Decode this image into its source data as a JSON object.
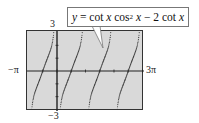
{
  "chart_data": {
    "type": "line",
    "function": "y = cot(x)*cos(x)^2 - 2*cot(x)",
    "xlabel": "",
    "ylabel": "",
    "xlim": [
      -3.14159,
      9.42478
    ],
    "ylim": [
      -3,
      3
    ],
    "x_tick_labels": {
      "min": "−π",
      "max": "3π"
    },
    "y_tick_labels": {
      "max": "3",
      "min": "−3"
    },
    "x_scale_ticks": "π/2",
    "y_scale_ticks": 1,
    "asymptotes_x": [
      0,
      3.14159,
      6.28319
    ],
    "zeros_x": [
      -1.5708,
      1.5708,
      4.71239,
      7.85398
    ],
    "style": "dotted",
    "grid": false,
    "background": "#d9d9d9"
  },
  "labels": {
    "y_max": "3",
    "y_min": "−3",
    "x_min": "−π",
    "x_max": "3π"
  },
  "callout": {
    "eq_y": "y",
    "eq_eq": " = cot ",
    "eq_x1": "x",
    "eq_cos": " cos",
    "eq_sup": "2",
    "eq_x2": " x",
    "eq_minus": " − 2 cot ",
    "eq_x3": "x"
  }
}
